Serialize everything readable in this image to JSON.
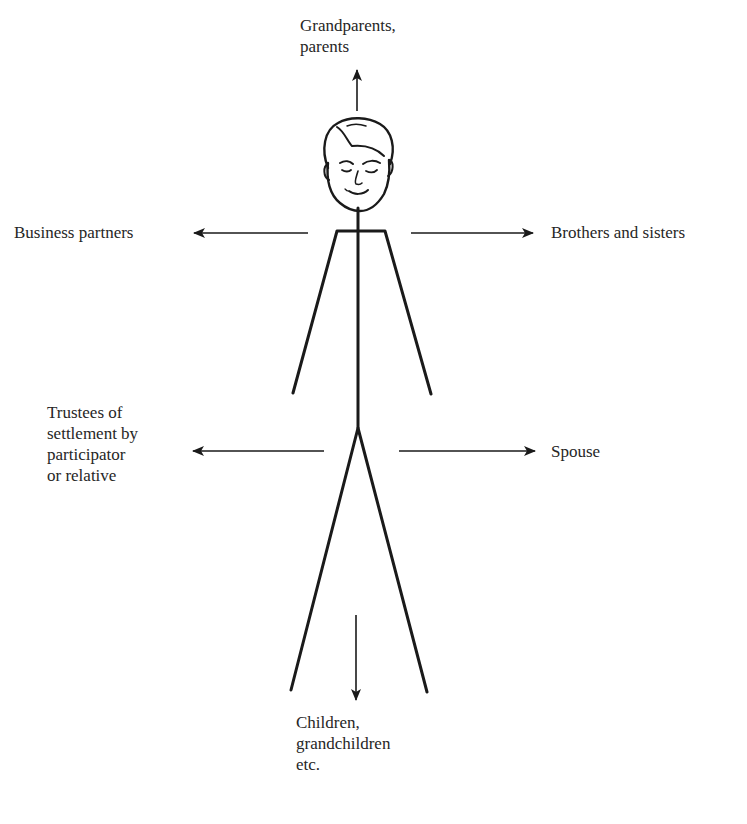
{
  "diagram": {
    "type": "relationship-diagram",
    "center": "Participator (stick figure)",
    "labels": {
      "top": "Grandparents,\nparents",
      "left_upper": "Business partners",
      "right_upper": "Brothers and sisters",
      "left_lower": "Trustees of\nsettlement by\nparticipator\nor relative",
      "right_lower": "Spouse",
      "bottom": "Children,\ngrandchildren\netc."
    },
    "arrows": [
      {
        "id": "to-top",
        "direction": "up",
        "target": "Grandparents, parents"
      },
      {
        "id": "to-left-upper",
        "direction": "left",
        "target": "Business partners"
      },
      {
        "id": "to-right-upper",
        "direction": "right",
        "target": "Brothers and sisters"
      },
      {
        "id": "to-left-lower",
        "direction": "left",
        "target": "Trustees of settlement by participator or relative"
      },
      {
        "id": "to-right-lower",
        "direction": "right",
        "target": "Spouse"
      },
      {
        "id": "to-bottom",
        "direction": "down",
        "target": "Children, grandchildren etc."
      }
    ],
    "colors": {
      "ink": "#1a1a1a",
      "background": "#ffffff"
    }
  }
}
